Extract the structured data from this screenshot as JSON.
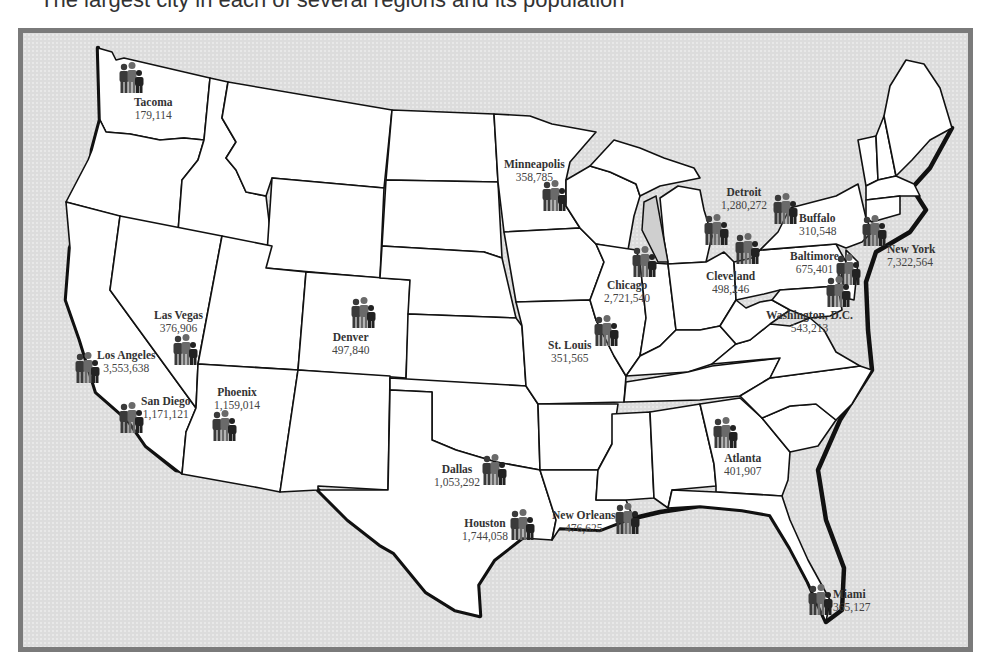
{
  "caption": {
    "text": "The largest city in each of several regions and its population"
  },
  "map": {
    "title": "Major U.S. Cities by Population",
    "colors": {
      "land": "#ffffff",
      "water": "#dcdcdc",
      "frame": "#7a7a7a",
      "border": "#111111",
      "icon_dark": "#3a3a3a",
      "icon_mid": "#6a6a6a"
    },
    "icon": "people-group-icon",
    "cities": [
      {
        "name": "Tacoma",
        "population": "179,114"
      },
      {
        "name": "Minneapolis",
        "population": "358,785"
      },
      {
        "name": "Detroit",
        "population": "1,280,272"
      },
      {
        "name": "Buffalo",
        "population": "310,548"
      },
      {
        "name": "New York",
        "population": "7,322,564"
      },
      {
        "name": "Chicago",
        "population": "2,721,540"
      },
      {
        "name": "Cleveland",
        "population": "498,246"
      },
      {
        "name": "Baltimore",
        "population": "675,401"
      },
      {
        "name": "Washington, D.C.",
        "population": "543,213"
      },
      {
        "name": "Las Vegas",
        "population": "376,906"
      },
      {
        "name": "Denver",
        "population": "497,840"
      },
      {
        "name": "Los Angeles",
        "population": "3,553,638"
      },
      {
        "name": "St. Louis",
        "population": "351,565"
      },
      {
        "name": "San Diego",
        "population": "1,171,121"
      },
      {
        "name": "Phoenix",
        "population": "1,159,014"
      },
      {
        "name": "Atlanta",
        "population": "401,907"
      },
      {
        "name": "Dallas",
        "population": "1,053,292"
      },
      {
        "name": "Houston",
        "population": "1,744,058"
      },
      {
        "name": "New Orleans",
        "population": "476,625"
      },
      {
        "name": "Miami",
        "population": "365,127"
      }
    ]
  }
}
